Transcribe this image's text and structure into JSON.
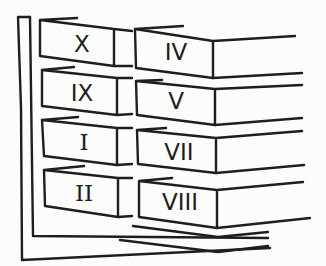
{
  "diagram": {
    "left_column": [
      {
        "label": "X"
      },
      {
        "label": "IX"
      },
      {
        "label": "I"
      },
      {
        "label": "II"
      }
    ],
    "right_column": [
      {
        "label": "IV"
      },
      {
        "label": "V"
      },
      {
        "label": "VII"
      },
      {
        "label": "VIII"
      }
    ],
    "colors": {
      "ink": "#1e1e1e",
      "paper": "#fcfcfa"
    }
  }
}
